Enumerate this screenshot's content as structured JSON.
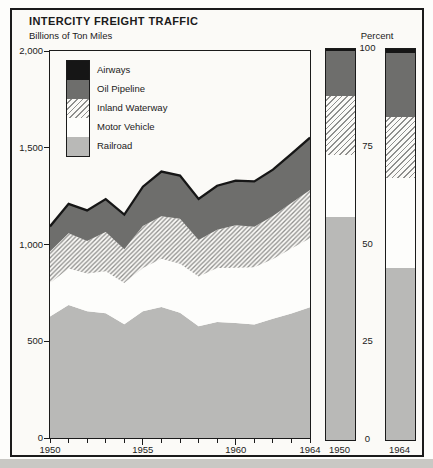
{
  "figure": {
    "title": "INTERCITY FREIGHT TRAFFIC",
    "subtitle": "Billions of Ton Miles"
  },
  "legend": {
    "items": [
      {
        "label": "Airways",
        "key": "airways"
      },
      {
        "label": "Oil Pipeline",
        "key": "oil_pipeline"
      },
      {
        "label": "Inland Waterway",
        "key": "inland_waterway"
      },
      {
        "label": "Motor Vehicle",
        "key": "motor_vehicle"
      },
      {
        "label": "Railroad",
        "key": "railroad"
      }
    ]
  },
  "colors": {
    "airways": "#161616",
    "oil_pipeline": "#6e6e6c",
    "inland_waterway": "hatch",
    "motor_vehicle": "#fdfdfb",
    "railroad": "#b9b9b7",
    "hatch_line": "#8f8f8d",
    "hatch_bg": "#fbfaf7",
    "total_line": "#161616",
    "frame": "#1b1b1b"
  },
  "chart_data": [
    {
      "type": "area",
      "stacked": true,
      "title": "INTERCITY FREIGHT TRAFFIC",
      "ylabel": "Billions of Ton Miles",
      "xlabel": "",
      "ylim": [
        0,
        2000
      ],
      "x": [
        1950,
        1951,
        1952,
        1953,
        1954,
        1955,
        1956,
        1957,
        1958,
        1959,
        1960,
        1961,
        1962,
        1963,
        1964
      ],
      "series": [
        {
          "name": "Railroad",
          "key": "railroad",
          "values": [
            628,
            688,
            655,
            645,
            588,
            655,
            677,
            647,
            578,
            600,
            595,
            586,
            616,
            644,
            676
          ]
        },
        {
          "name": "Motor Vehicle",
          "key": "motor_vehicle",
          "values": [
            173,
            188,
            195,
            217,
            213,
            223,
            249,
            254,
            256,
            279,
            285,
            296,
            309,
            336,
            356
          ]
        },
        {
          "name": "Inland Waterway",
          "key": "inland_waterway",
          "values": [
            163,
            182,
            168,
            202,
            174,
            217,
            220,
            232,
            190,
            197,
            220,
            210,
            223,
            234,
            250
          ]
        },
        {
          "name": "Oil Pipeline",
          "key": "oil_pipeline",
          "values": [
            129,
            152,
            158,
            170,
            179,
            203,
            230,
            223,
            211,
            227,
            229,
            233,
            238,
            253,
            269
          ]
        },
        {
          "name": "Airways",
          "key": "airways",
          "values": [
            0.3,
            0.3,
            0.4,
            0.4,
            0.4,
            0.5,
            0.6,
            0.6,
            0.6,
            0.7,
            0.8,
            0.9,
            1.3,
            1.3,
            1.5
          ]
        }
      ],
      "yticks": [
        {
          "v": 2000,
          "label": "2,000"
        },
        {
          "v": 1500,
          "label": "1,500"
        },
        {
          "v": 1000,
          "label": "1,000"
        },
        {
          "v": 500,
          "label": "500"
        },
        {
          "v": 0,
          "label": "0"
        }
      ],
      "xtick_labels": [
        {
          "year": 1950,
          "label": "1950"
        },
        {
          "year": 1955,
          "label": "1955"
        },
        {
          "year": 1960,
          "label": "1960"
        },
        {
          "year": 1964,
          "label": "1964"
        }
      ],
      "major_ticks": [
        1955,
        1960
      ],
      "grid": false,
      "legend_position": "top-left-inside"
    },
    {
      "type": "bar",
      "stacked": true,
      "unit": "percent",
      "ylabel": "Percent",
      "ylim": [
        0,
        100
      ],
      "categories": [
        "1950",
        "1964"
      ],
      "series": [
        {
          "name": "Railroad",
          "key": "railroad",
          "values": [
            57.0,
            44.0
          ]
        },
        {
          "name": "Motor Vehicle",
          "key": "motor_vehicle",
          "values": [
            16.0,
            23.0
          ]
        },
        {
          "name": "Inland Waterway",
          "key": "inland_waterway",
          "values": [
            15.0,
            15.5
          ]
        },
        {
          "name": "Oil Pipeline",
          "key": "oil_pipeline",
          "values": [
            11.5,
            16.5
          ]
        },
        {
          "name": "Airways",
          "key": "airways",
          "values": [
            0.5,
            1.0
          ]
        }
      ],
      "yticks": [
        {
          "v": 100,
          "label": "100"
        },
        {
          "v": 75,
          "label": "75"
        },
        {
          "v": 50,
          "label": "50"
        },
        {
          "v": 25,
          "label": "25"
        },
        {
          "v": 0,
          "label": "0"
        }
      ]
    }
  ]
}
